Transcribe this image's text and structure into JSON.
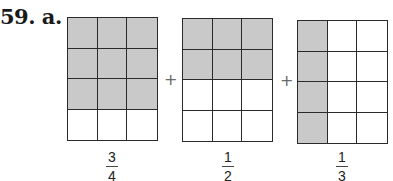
{
  "problem_label": "59. a.",
  "colors": {
    "shaded": "#c9c9c9",
    "line": "#2a2a2a",
    "background": "#ffffff"
  },
  "operator": "+",
  "grids": [
    {
      "rows": 4,
      "cols": 3,
      "shaded": [
        [
          1,
          1,
          1
        ],
        [
          1,
          1,
          1
        ],
        [
          1,
          1,
          1
        ],
        [
          0,
          0,
          0
        ]
      ],
      "fraction": {
        "numerator": "3",
        "denominator": "4"
      }
    },
    {
      "rows": 4,
      "cols": 3,
      "shaded": [
        [
          1,
          1,
          1
        ],
        [
          1,
          1,
          1
        ],
        [
          0,
          0,
          0
        ],
        [
          0,
          0,
          0
        ]
      ],
      "fraction": {
        "numerator": "1",
        "denominator": "2"
      }
    },
    {
      "rows": 4,
      "cols": 3,
      "shaded": [
        [
          1,
          0,
          0
        ],
        [
          1,
          0,
          0
        ],
        [
          1,
          0,
          0
        ],
        [
          1,
          0,
          0
        ]
      ],
      "fraction": {
        "numerator": "1",
        "denominator": "3"
      }
    }
  ]
}
